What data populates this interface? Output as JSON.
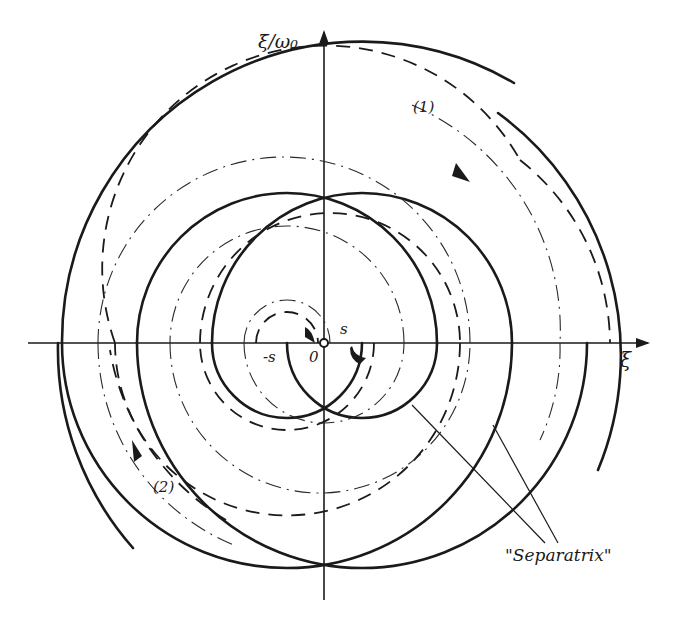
{
  "figure": {
    "type": "phase-portrait"
  },
  "axes": {
    "x_label": "ξ",
    "y_label": "ξ̇/ω₀",
    "origin_label": "0"
  },
  "markers": {
    "s_pos": "s",
    "s_neg": "-s"
  },
  "curves": {
    "trajectory_1_label": "(1)",
    "trajectory_2_label": "(2)",
    "separatrix_label": "\"Separatrix\""
  },
  "legend_styles": {
    "solid": "separatrix spiral",
    "dashed": "trajectory",
    "dash_dot": "trajectory"
  },
  "colors": {
    "ink": "#1a1a1a",
    "background": "#ffffff"
  }
}
